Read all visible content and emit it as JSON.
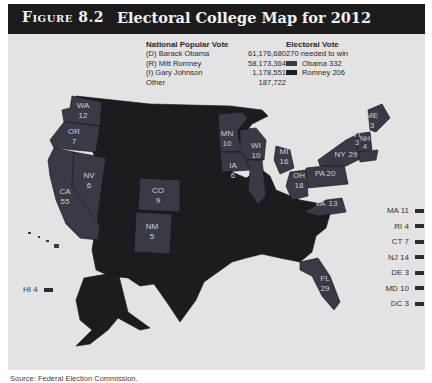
{
  "figure": {
    "label": "Figure 8.2",
    "title": "Electoral College Map for 2012"
  },
  "popular_vote": {
    "heading": "National Popular Vote",
    "rows": [
      {
        "candidate": "(D) Barack Obama",
        "votes": "61,176,680"
      },
      {
        "candidate": "(R) Mitt Romney",
        "votes": "58,173,364"
      },
      {
        "candidate": "(I) Gary Johnson",
        "votes": "1,178,551"
      },
      {
        "candidate": "Other",
        "votes": "187,722"
      }
    ]
  },
  "electoral_vote": {
    "heading": "Electoral Vote",
    "subheading": "270 needed to win",
    "entries": [
      {
        "label": "Obama 332",
        "color": "#3a3a46"
      },
      {
        "label": "Romney 206",
        "color": "#1c1c20"
      }
    ]
  },
  "colors": {
    "obama": "#3a3a46",
    "romney": "#1c1c20",
    "background": "#e3e3e3",
    "title_bar": "#1c1c1c"
  },
  "map_labels": [
    {
      "state": "WA",
      "ev": "12"
    },
    {
      "state": "OR",
      "ev": "7"
    },
    {
      "state": "NV",
      "ev": "6"
    },
    {
      "state": "CA",
      "ev": "55"
    },
    {
      "state": "CO",
      "ev": "9"
    },
    {
      "state": "NM",
      "ev": "5"
    },
    {
      "state": "MN",
      "ev": "10"
    },
    {
      "state": "IA",
      "ev": "6"
    },
    {
      "state": "WI",
      "ev": "10"
    },
    {
      "state": "MI",
      "ev": "16"
    },
    {
      "state": "OH",
      "ev": "18"
    },
    {
      "state": "PA",
      "ev": "20"
    },
    {
      "state": "NY",
      "ev": "29"
    },
    {
      "state": "VA",
      "ev": "13"
    },
    {
      "state": "FL",
      "ev": "29"
    },
    {
      "state": "ME",
      "ev": "3"
    },
    {
      "state": "VT",
      "ev": "3"
    },
    {
      "state": "NH",
      "ev": "4"
    }
  ],
  "small_states": [
    {
      "label": "MA 11"
    },
    {
      "label": "RI 4"
    },
    {
      "label": "CT 7"
    },
    {
      "label": "NJ 14"
    },
    {
      "label": "DE 3"
    },
    {
      "label": "MD 10"
    },
    {
      "label": "DC 3"
    }
  ],
  "hawaii": {
    "label": "HI 4"
  },
  "source": "Source: Federal Election Commission."
}
